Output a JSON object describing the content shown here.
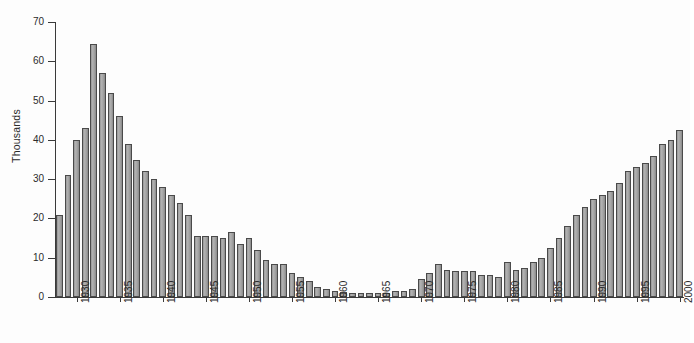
{
  "chart_data": {
    "type": "bar",
    "title": "",
    "subtitle": "",
    "xlabel": "",
    "ylabel": "Thousands",
    "ylim": [
      0,
      70
    ],
    "ytick_labels": [
      "0",
      "10",
      "20",
      "30",
      "40",
      "50",
      "60",
      "70"
    ],
    "ytick_values": [
      0,
      10,
      20,
      30,
      40,
      50,
      60,
      70
    ],
    "xtick_labels": [
      "1930",
      "1935",
      "1940",
      "1945",
      "1950",
      "1955",
      "1960",
      "1965",
      "1970",
      "1975",
      "1980",
      "1985",
      "1990",
      "1995",
      "2000"
    ],
    "xtick_values": [
      1930,
      1935,
      1940,
      1945,
      1950,
      1955,
      1960,
      1965,
      1970,
      1975,
      1980,
      1985,
      1990,
      1995,
      2000
    ],
    "grid": false,
    "legend": null,
    "bar_color": "#9d9d9d",
    "bar_edge_color": "#4a4a4a",
    "axis_color": "#3a3a3a",
    "background_color": "#fdfdfd",
    "categories": [
      1928,
      1929,
      1930,
      1931,
      1932,
      1933,
      1934,
      1935,
      1936,
      1937,
      1938,
      1939,
      1940,
      1941,
      1942,
      1943,
      1944,
      1945,
      1946,
      1947,
      1948,
      1949,
      1950,
      1951,
      1952,
      1953,
      1954,
      1955,
      1956,
      1957,
      1958,
      1959,
      1960,
      1961,
      1962,
      1963,
      1964,
      1965,
      1966,
      1967,
      1968,
      1969,
      1970,
      1971,
      1972,
      1973,
      1974,
      1975,
      1976,
      1977,
      1978,
      1979,
      1980,
      1981,
      1982,
      1983,
      1984,
      1985,
      1986,
      1987,
      1988,
      1989,
      1990,
      1991,
      1992,
      1993,
      1994,
      1995,
      1996,
      1997,
      1998,
      1999,
      2000
    ],
    "values": [
      21,
      31,
      40,
      43,
      64.5,
      57,
      52,
      46,
      39,
      35,
      32,
      30,
      28,
      26,
      24,
      21,
      15.5,
      15.5,
      15.5,
      15,
      16.5,
      13.5,
      15,
      12,
      9.5,
      8.5,
      8.5,
      6,
      5,
      4,
      2.5,
      2,
      1.5,
      1.2,
      1,
      1,
      1,
      1,
      1,
      1.5,
      1.5,
      2,
      4.5,
      6,
      8.5,
      7,
      6.5,
      6.5,
      6.5,
      5.5,
      5.5,
      5,
      9,
      7,
      7.5,
      9,
      10,
      12.5,
      15,
      18,
      21,
      23,
      25,
      26,
      27,
      29,
      32,
      33,
      34,
      36,
      39,
      40,
      42.5
    ]
  }
}
